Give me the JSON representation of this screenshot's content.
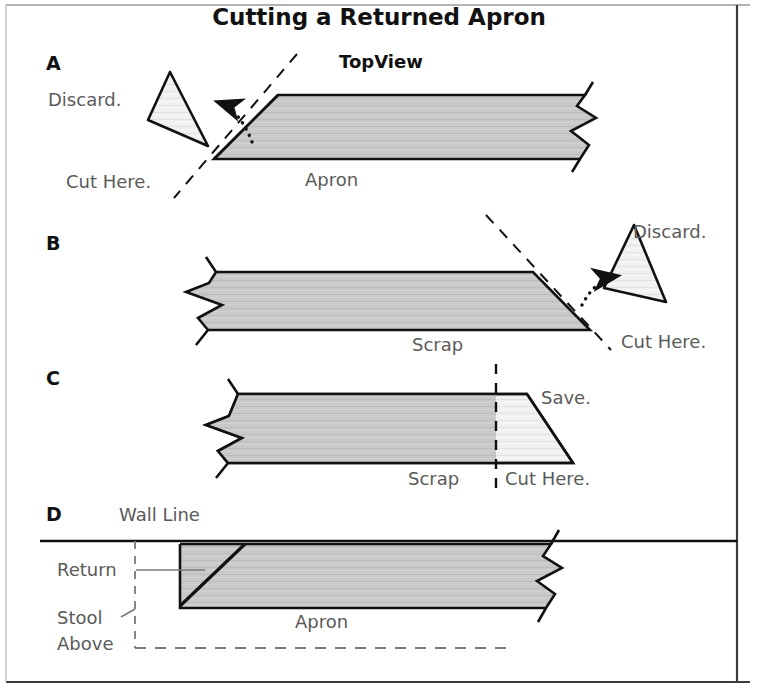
{
  "figure": {
    "title": "Cutting a Returned Apron",
    "subtitle": "TopView"
  },
  "panels": [
    {
      "id": "A",
      "letter": "A",
      "labels": {
        "discard": "Discard.",
        "cut_here": "Cut Here.",
        "part": "Apron"
      }
    },
    {
      "id": "B",
      "letter": "B",
      "labels": {
        "discard": "Discard.",
        "cut_here": "Cut Here.",
        "part": "Scrap"
      }
    },
    {
      "id": "C",
      "letter": "C",
      "labels": {
        "save": "Save.",
        "cut_here": "Cut Here.",
        "part": "Scrap"
      }
    },
    {
      "id": "D",
      "letter": "D",
      "labels": {
        "wall_line": "Wall Line",
        "return": "Return",
        "stool": "Stool",
        "above": "Above",
        "part": "Apron"
      }
    }
  ],
  "colors": {
    "board_fill": "#c9c9c9",
    "save_fill": "#f0f0f0",
    "outline": "#111111",
    "label_text": "#5a5a5a",
    "heading_text": "#111111",
    "frame": "#222222"
  }
}
